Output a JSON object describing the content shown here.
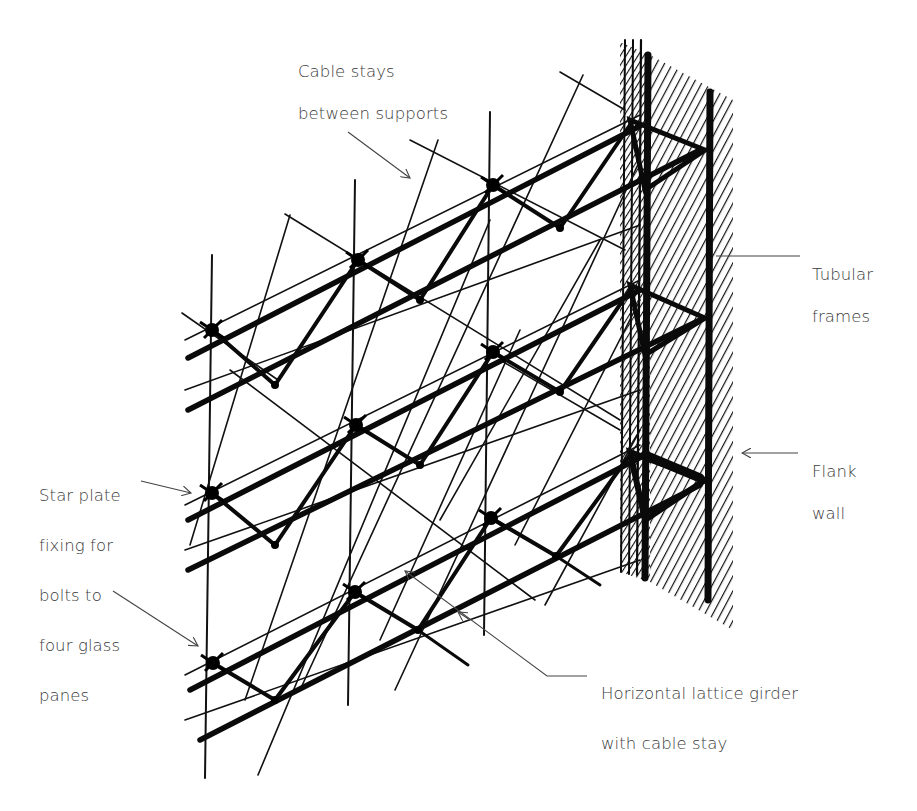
{
  "diagram": {
    "background": "#ffffff",
    "ink": "#111111",
    "label_color": "#3a3a3a",
    "labels": [
      {
        "id": "cable-stays",
        "lines": [
          "Cable stays",
          "between supports"
        ],
        "x": 298,
        "y": 40
      },
      {
        "id": "tubular-frames",
        "lines": [
          "Tubular",
          "frames"
        ],
        "x": 812,
        "y": 236
      },
      {
        "id": "flank-wall",
        "lines": [
          "Flank",
          "wall"
        ],
        "x": 812,
        "y": 440
      },
      {
        "id": "star-plate",
        "lines": [
          "Star plate",
          "fixing for",
          "bolts to",
          "four glass",
          "panes"
        ],
        "x": 39,
        "y": 451
      },
      {
        "id": "lattice-girder",
        "lines": [
          "Horizontal lattice girder",
          "with cable stay"
        ],
        "x": 601,
        "y": 651
      }
    ],
    "leaders": [
      {
        "for": "cable-stays",
        "points": [
          [
            348,
            132
          ],
          [
            410,
            178
          ]
        ],
        "arrow": true
      },
      {
        "for": "tubular-frames",
        "points": [
          [
            800,
            256
          ],
          [
            716,
            256
          ]
        ],
        "arrow": false
      },
      {
        "for": "flank-wall",
        "points": [
          [
            798,
            453
          ],
          [
            742,
            453
          ]
        ],
        "arrow": true
      },
      {
        "for": "star-plate-1",
        "points": [
          [
            141,
            481
          ],
          [
            191,
            493
          ]
        ],
        "arrow": true
      },
      {
        "for": "star-plate-2",
        "points": [
          [
            113,
            591
          ],
          [
            198,
            646
          ]
        ],
        "arrow": true
      },
      {
        "for": "lattice-girder-1",
        "points": [
          [
            595,
            676
          ],
          [
            547,
            676
          ],
          [
            405,
            571
          ]
        ],
        "arrow": true
      },
      {
        "for": "lattice-girder-2",
        "points": [
          [
            405,
            571
          ],
          [
            458,
            612
          ]
        ],
        "arrow": false
      }
    ],
    "mullions": [
      {
        "x1": 212,
        "y1": 255,
        "x2": 205,
        "y2": 778
      },
      {
        "x1": 355,
        "y1": 180,
        "x2": 348,
        "y2": 705
      },
      {
        "x1": 490,
        "y1": 112,
        "x2": 484,
        "y2": 635
      }
    ],
    "nodes": [
      [
        212,
        330
      ],
      [
        358,
        260
      ],
      [
        493,
        185
      ],
      [
        212,
        493
      ],
      [
        356,
        425
      ],
      [
        493,
        352
      ],
      [
        213,
        663
      ],
      [
        355,
        592
      ],
      [
        491,
        518
      ]
    ],
    "girder_rows": [
      {
        "front": [
          [
            188,
            358
          ],
          [
            640,
            126
          ]
        ],
        "back": [
          [
            188,
            410
          ],
          [
            700,
            150
          ]
        ]
      },
      {
        "front": [
          [
            188,
            520
          ],
          [
            640,
            290
          ]
        ],
        "back": [
          [
            188,
            570
          ],
          [
            700,
            320
          ]
        ]
      },
      {
        "front": [
          [
            190,
            690
          ],
          [
            645,
            455
          ]
        ],
        "back": [
          [
            200,
            740
          ],
          [
            700,
            485
          ]
        ]
      }
    ]
  }
}
